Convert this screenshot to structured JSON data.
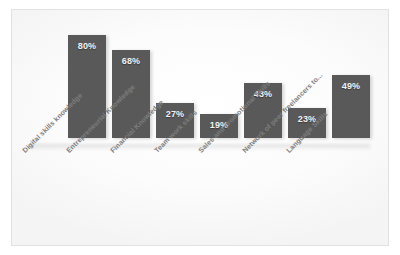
{
  "chart_data": {
    "type": "bar",
    "title": "",
    "subtitle": "",
    "xlabel": "",
    "ylabel": "",
    "ylim": [
      0,
      100
    ],
    "grid": false,
    "legend": "none",
    "orientation": "vertical",
    "value_suffix": "%",
    "bar_color": "#595959",
    "background_color": "#fbfbfb",
    "border_color": "#e2e2e2",
    "data_label_color": "#f2f2f2",
    "category_label_color": "#7d7d7d",
    "category_label_rotation": -45,
    "categories": [
      "Digital skills knowledge",
      "Entrepreneurial Knowledge",
      "Financial Knowledge",
      "Team work skills",
      "Sales and promotional Skills",
      "Network of peer freelancers to...",
      "Language Skills"
    ],
    "values": [
      80,
      68,
      27,
      19,
      43,
      23,
      49
    ],
    "data_labels": [
      "80%",
      "68%",
      "27%",
      "19%",
      "43%",
      "23%",
      "49%"
    ]
  }
}
